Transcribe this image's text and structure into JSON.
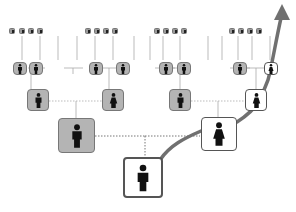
{
  "diagram": {
    "type": "ancestry-tree",
    "colors": {
      "ancestor_fill": "#b4b4b4",
      "highlighted_fill": "#ffffff",
      "border": "#555555",
      "arrow": "#707070",
      "connector_dotted": "#8a8a8a"
    },
    "generations": [
      {
        "level": 1,
        "label": "self",
        "count": 1,
        "nodes": [
          {
            "sex": "male",
            "highlighted": true
          }
        ]
      },
      {
        "level": 2,
        "label": "parents",
        "count": 2,
        "nodes": [
          {
            "sex": "male",
            "highlighted": false
          },
          {
            "sex": "female",
            "highlighted": true
          }
        ]
      },
      {
        "level": 3,
        "label": "grandparents",
        "count": 4,
        "nodes": [
          {
            "sex": "male",
            "highlighted": false
          },
          {
            "sex": "female",
            "highlighted": false
          },
          {
            "sex": "male",
            "highlighted": false
          },
          {
            "sex": "female",
            "highlighted": true
          }
        ]
      },
      {
        "level": 4,
        "label": "great-grandparents",
        "count": 8,
        "highlighted_index": 7
      },
      {
        "level": 5,
        "label": "great-great-grandparents",
        "count": 16
      }
    ],
    "arrow": {
      "label": "maternal-line-arrow",
      "direction": "up"
    }
  }
}
